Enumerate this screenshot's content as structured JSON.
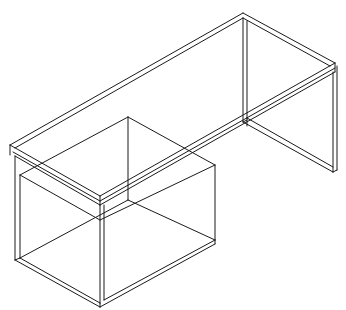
{
  "drawing": {
    "subject": "desk-with-pedestal-wireframe",
    "projection": "isometric",
    "stroke_color": "#1a1a1a",
    "background_color": "#ffffff",
    "stroke_width": 1
  },
  "parts": [
    {
      "name": "desktop-top-surface",
      "lines": [
        [
          243,
          13,
          335,
          63
        ],
        [
          243,
          13,
          10,
          145
        ],
        [
          10,
          145,
          100,
          196
        ],
        [
          100,
          196,
          335,
          63
        ],
        [
          243,
          18,
          330,
          66
        ],
        [
          243,
          18,
          15,
          148
        ],
        [
          13,
          152,
          100,
          201
        ],
        [
          100,
          201,
          335,
          68
        ],
        [
          15,
          156,
          100,
          205
        ],
        [
          100,
          205,
          335,
          72
        ],
        [
          10,
          145,
          10,
          155
        ],
        [
          335,
          63,
          335,
          72
        ],
        [
          100,
          196,
          100,
          205
        ]
      ]
    },
    {
      "name": "right-leg-panel",
      "lines": [
        [
          243,
          18,
          243,
          122
        ],
        [
          247,
          21,
          247,
          118
        ],
        [
          243,
          122,
          333,
          172
        ],
        [
          247,
          118,
          333,
          167
        ],
        [
          333,
          72,
          333,
          172
        ],
        [
          337,
          66,
          337,
          170
        ],
        [
          333,
          172,
          337,
          170
        ],
        [
          247,
          118,
          247,
          126
        ],
        [
          243,
          122,
          247,
          120
        ]
      ]
    },
    {
      "name": "pedestal-cabinet",
      "lines": [
        [
          128,
          117,
          215,
          165
        ],
        [
          128,
          117,
          20,
          175
        ],
        [
          128,
          117,
          128,
          200
        ],
        [
          215,
          165,
          215,
          240
        ],
        [
          20,
          175,
          20,
          258
        ],
        [
          15,
          156,
          15,
          260
        ],
        [
          20,
          175,
          100,
          220
        ],
        [
          100,
          220,
          215,
          165
        ],
        [
          100,
          205,
          100,
          303
        ],
        [
          104,
          205,
          104,
          300
        ],
        [
          15,
          260,
          100,
          307
        ],
        [
          20,
          258,
          100,
          303
        ],
        [
          104,
          300,
          215,
          240
        ],
        [
          100,
          307,
          215,
          244
        ],
        [
          215,
          240,
          215,
          244
        ],
        [
          128,
          200,
          215,
          240
        ],
        [
          128,
          200,
          20,
          258
        ],
        [
          15,
          260,
          20,
          258
        ],
        [
          100,
          303,
          100,
          307
        ]
      ]
    }
  ]
}
